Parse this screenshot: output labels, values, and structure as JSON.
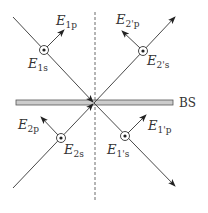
{
  "diagram": {
    "beam_splitter_label": "BS",
    "labels": {
      "e1p": {
        "main": "E",
        "sub": "1p"
      },
      "e1s": {
        "main": "E",
        "sub": "1s"
      },
      "e2pp": {
        "main": "E",
        "sub": "2'p"
      },
      "e2ps": {
        "main": "E",
        "sub": "2's"
      },
      "e2p": {
        "main": "E",
        "sub": "2p"
      },
      "e2s": {
        "main": "E",
        "sub": "2s"
      },
      "e1pp": {
        "main": "E",
        "sub": "1'p"
      },
      "e1ps": {
        "main": "E",
        "sub": "1's"
      }
    },
    "colors": {
      "line": "#333333",
      "bs_fill": "#cccccc"
    }
  }
}
